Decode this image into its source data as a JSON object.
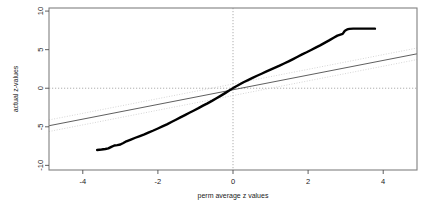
{
  "chart_data": {
    "type": "scatter",
    "title": "",
    "subtitle": "",
    "xlabel": "perm average z values",
    "ylabel": "actual z-values",
    "xlim": [
      -4.9,
      4.9
    ],
    "ylim": [
      -10.6,
      10.4
    ],
    "grid": false,
    "legend": null,
    "xticks": [
      -4,
      -2,
      0,
      2,
      4
    ],
    "xticklabels": [
      "-4",
      "-2",
      "0",
      "2",
      "4"
    ],
    "yticks": [
      10,
      5,
      0,
      -5,
      -10
    ],
    "yticklabels": [
      "10",
      "5",
      "0",
      "-5",
      "-10"
    ],
    "annotations": [
      {
        "name": "vertical-zero-line",
        "type": "dotted-vline",
        "x": 0
      },
      {
        "name": "horizontal-zero-line",
        "type": "dotted-hline",
        "y": 0
      }
    ],
    "series": [
      {
        "name": "qq-curve",
        "style": "thick-black-line",
        "color": "#000000",
        "x": [
          -3.62,
          -3.5,
          -3.4,
          -3.32,
          -3.24,
          -3.16,
          -3.08,
          -3.0,
          -2.92,
          -2.84,
          -2.72,
          -2.6,
          -2.48,
          -2.36,
          -2.24,
          -2.12,
          -2.0,
          -1.88,
          -1.76,
          -1.64,
          -1.52,
          -1.4,
          -1.28,
          -1.16,
          -1.04,
          -0.92,
          -0.8,
          -0.68,
          -0.56,
          -0.44,
          -0.32,
          -0.2,
          -0.08,
          0.04,
          0.16,
          0.28,
          0.4,
          0.52,
          0.64,
          0.76,
          0.88,
          1.0,
          1.12,
          1.24,
          1.36,
          1.48,
          1.6,
          1.72,
          1.84,
          1.96,
          2.08,
          2.2,
          2.32,
          2.44,
          2.56,
          2.68,
          2.78,
          2.86,
          2.92,
          2.98,
          3.04,
          3.1,
          3.2,
          3.35,
          3.5,
          3.65,
          3.78
        ],
        "y": [
          -8.0,
          -7.95,
          -7.88,
          -7.8,
          -7.6,
          -7.42,
          -7.38,
          -7.3,
          -7.1,
          -6.88,
          -6.65,
          -6.42,
          -6.2,
          -5.98,
          -5.72,
          -5.48,
          -5.22,
          -4.95,
          -4.68,
          -4.38,
          -4.08,
          -3.78,
          -3.48,
          -3.18,
          -2.88,
          -2.58,
          -2.26,
          -1.96,
          -1.64,
          -1.3,
          -0.96,
          -0.6,
          -0.24,
          0.12,
          0.45,
          0.78,
          1.06,
          1.34,
          1.62,
          1.88,
          2.14,
          2.4,
          2.66,
          2.92,
          3.2,
          3.48,
          3.78,
          4.08,
          4.38,
          4.66,
          4.96,
          5.26,
          5.56,
          5.88,
          6.2,
          6.55,
          6.82,
          6.95,
          7.05,
          7.45,
          7.62,
          7.7,
          7.72,
          7.72,
          7.72,
          7.72,
          7.72
        ]
      },
      {
        "name": "reference-line",
        "style": "solid-gray-line",
        "color": "#4d4d4d",
        "slope": 0.95,
        "intercept": -0.2,
        "x": [
          -4.9,
          4.9
        ],
        "y": [
          -4.86,
          4.46
        ]
      },
      {
        "name": "confidence-band-upper",
        "style": "dotted-light-line",
        "color": "#cccccc",
        "slope": 0.95,
        "intercept": 0.55,
        "x": [
          -4.9,
          4.9
        ],
        "y": [
          -4.11,
          5.21
        ]
      },
      {
        "name": "confidence-band-lower",
        "style": "dotted-light-line",
        "color": "#cccccc",
        "slope": 0.95,
        "intercept": -0.95,
        "x": [
          -4.9,
          4.9
        ],
        "y": [
          -5.61,
          3.71
        ]
      }
    ],
    "colors": {
      "frame": "#808080",
      "data": "#000000",
      "reference": "#4d4d4d",
      "band": "#cccccc",
      "crosshair": "#999999",
      "text": "#1a1a1a",
      "background": "#ffffff"
    }
  }
}
